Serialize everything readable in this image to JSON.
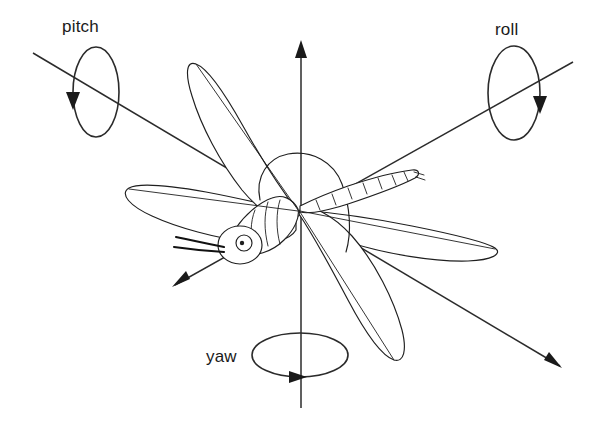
{
  "figure": {
    "background_color": "#ffffff",
    "line_color": "#1f1f1f",
    "axis_color": "#2b2b2b",
    "width": 603,
    "height": 446
  },
  "labels": {
    "pitch": "pitch",
    "roll": "roll",
    "yaw": "yaw"
  },
  "axes": [
    {
      "id": "pitch",
      "label": "pitch",
      "label_x": 62,
      "label_y": 32,
      "line": {
        "x1": 33,
        "y1": 53,
        "x2": 560,
        "y2": 366
      },
      "arrow_at": "end",
      "arrow_x": 560,
      "arrow_y": 366,
      "rotation_ellipse": {
        "cx": 96,
        "cy": 92,
        "rx": 23,
        "ry": 45,
        "tilt": 0
      },
      "rotation_arrow_x": 73,
      "rotation_arrow_y": 101,
      "rotation_arrow_dir": "down"
    },
    {
      "id": "roll",
      "label": "roll",
      "label_x": 495,
      "label_y": 35,
      "line": {
        "x1": 573,
        "y1": 62,
        "x2": 175,
        "y2": 285
      },
      "arrow_at": "end",
      "arrow_x": 175,
      "arrow_y": 285,
      "rotation_ellipse": {
        "cx": 514,
        "cy": 93,
        "rx": 26,
        "ry": 47,
        "tilt": 0
      },
      "rotation_arrow_x": 540,
      "rotation_arrow_y": 104,
      "rotation_arrow_dir": "down"
    },
    {
      "id": "yaw",
      "label": "yaw",
      "label_x": 206,
      "label_y": 362,
      "line": {
        "x1": 301,
        "y1": 45,
        "x2": 301,
        "y2": 408
      },
      "arrow_at": "start",
      "arrow_x": 301,
      "arrow_y": 45,
      "rotation_ellipse": {
        "cx": 300,
        "cy": 355,
        "rx": 48,
        "ry": 22,
        "tilt": 0
      },
      "rotation_arrow_x": 292,
      "rotation_arrow_y": 377,
      "rotation_arrow_dir": "right"
    }
  ],
  "body_parts": [
    "head",
    "eye",
    "antennae",
    "thorax",
    "abdomen",
    "wing-fore-left",
    "wing-hind-left",
    "wing-fore-right",
    "wing-hind-right"
  ],
  "abdomen_segments": 8
}
